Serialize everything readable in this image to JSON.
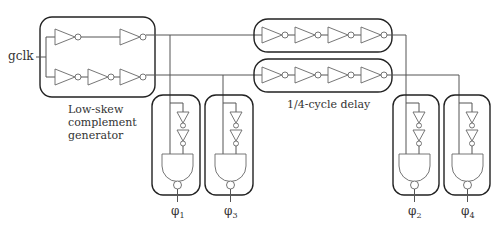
{
  "diagram": {
    "input_label": "gclk",
    "blocks": {
      "complement_generator": {
        "label_lines": [
          "Low-skew",
          "complement",
          "generator"
        ]
      },
      "delay": {
        "label": "1/4-cycle delay",
        "chains": 2,
        "inverters_per_chain": 4
      }
    },
    "outputs": [
      {
        "name": "φ",
        "sub": "1"
      },
      {
        "name": "φ",
        "sub": "3"
      },
      {
        "name": "φ",
        "sub": "2"
      },
      {
        "name": "φ",
        "sub": "4"
      }
    ],
    "colors": {
      "stroke": "#222222",
      "wire": "#555555",
      "text": "#333333",
      "background": "#ffffff"
    }
  }
}
